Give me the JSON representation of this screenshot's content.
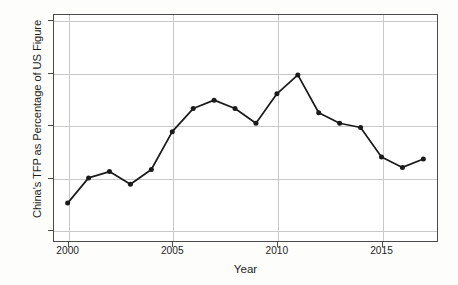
{
  "chart_data": {
    "type": "line",
    "title": "",
    "subtitle": "",
    "xlabel": "Year",
    "ylabel": "China's TFP as Percentage of US Figure",
    "x": [
      2000,
      2001,
      2002,
      2003,
      2004,
      2005,
      2006,
      2007,
      2008,
      2009,
      2010,
      2011,
      2012,
      2013,
      2014,
      2015,
      2016,
      2017
    ],
    "values": [
      36.3,
      37.5,
      37.8,
      37.2,
      37.9,
      39.7,
      40.8,
      41.2,
      40.8,
      40.1,
      41.5,
      42.4,
      40.6,
      40.1,
      39.9,
      38.5,
      38.0,
      38.4
    ],
    "series": [
      {
        "name": "China's TFP as Percentage of US Figure",
        "values": [
          36.3,
          37.5,
          37.8,
          37.2,
          37.9,
          39.7,
          40.8,
          41.2,
          40.8,
          40.1,
          41.5,
          42.4,
          40.6,
          40.1,
          39.9,
          38.5,
          38.0,
          38.4
        ]
      }
    ],
    "xlim": [
      1999.3,
      2017.7
    ],
    "ylim": [
      34.45,
      45.3
    ],
    "xticks": [
      2000,
      2005,
      2010,
      2015
    ],
    "xtick_labels": [
      "2000",
      "2005",
      "2010",
      "2015"
    ],
    "yticks": [
      35.0,
      37.5,
      40.0,
      42.5,
      45.0
    ],
    "ytick_labels": [
      "35.0",
      "37.5",
      "40.0",
      "42.5",
      "45.0"
    ],
    "grid": true,
    "grid_axis": "both",
    "legend": false,
    "legend_position": "none",
    "marker": "circle",
    "line_color": "#1a1a1a",
    "marker_color": "#1a1a1a",
    "grid_color": "#c9c9c9",
    "frame_color": "#4a4a4a",
    "background_color": "#ffffff",
    "annotations": []
  }
}
